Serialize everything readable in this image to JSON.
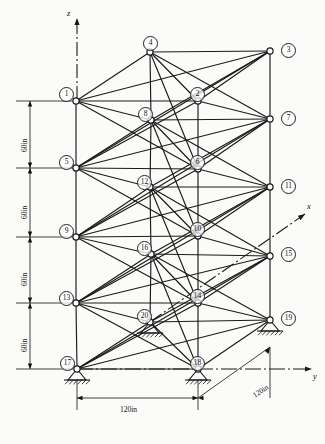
{
  "figure": {
    "type": "structural-truss-diagram",
    "caption": ""
  },
  "axes": {
    "z": {
      "label": "z",
      "direction": "up"
    },
    "y": {
      "label": "y",
      "direction": "right"
    },
    "x": {
      "label": "x",
      "direction": "up-right-isometric"
    }
  },
  "dimensions": {
    "vertical": [
      {
        "label": "60in",
        "value": 60,
        "unit": "in"
      },
      {
        "label": "60in",
        "value": 60,
        "unit": "in"
      },
      {
        "label": "60in",
        "value": 60,
        "unit": "in"
      },
      {
        "label": "60in",
        "value": 60,
        "unit": "in"
      }
    ],
    "horizontal": {
      "label": "120in",
      "value": 120,
      "unit": "in"
    },
    "depth": {
      "label": "120in",
      "value": 120,
      "unit": "in"
    }
  },
  "nodes": [
    {
      "id": "1",
      "label": "1",
      "x": 76,
      "y": 101,
      "lx": 59,
      "ly": 87,
      "face": "front-left"
    },
    {
      "id": "2",
      "label": "2",
      "x": 198,
      "y": 101,
      "lx": 190,
      "ly": 87,
      "face": "front-right"
    },
    {
      "id": "3",
      "label": "3",
      "x": 270,
      "y": 51,
      "lx": 281,
      "ly": 43,
      "face": "back-right"
    },
    {
      "id": "4",
      "label": "4",
      "x": 150,
      "y": 52,
      "lx": 143,
      "ly": 36,
      "face": "back-left"
    },
    {
      "id": "5",
      "label": "5",
      "x": 76,
      "y": 168,
      "lx": 59,
      "ly": 155,
      "face": "front-left"
    },
    {
      "id": "6",
      "label": "6",
      "x": 198,
      "y": 169,
      "lx": 190,
      "ly": 155,
      "face": "front-right"
    },
    {
      "id": "7",
      "label": "7",
      "x": 270,
      "y": 119,
      "lx": 281,
      "ly": 111,
      "face": "back-right"
    },
    {
      "id": "8",
      "label": "8",
      "x": 151,
      "y": 120,
      "lx": 138,
      "ly": 107,
      "face": "back-left"
    },
    {
      "id": "9",
      "label": "9",
      "x": 76,
      "y": 237,
      "lx": 59,
      "ly": 224,
      "face": "front-left"
    },
    {
      "id": "10",
      "label": "10",
      "x": 198,
      "y": 236,
      "lx": 190,
      "ly": 222,
      "face": "front-right"
    },
    {
      "id": "11",
      "label": "11",
      "x": 270,
      "y": 187,
      "lx": 281,
      "ly": 179,
      "face": "back-right"
    },
    {
      "id": "12",
      "label": "12",
      "x": 150,
      "y": 187,
      "lx": 137,
      "ly": 175,
      "face": "back-left"
    },
    {
      "id": "13",
      "label": "13",
      "x": 76,
      "y": 303,
      "lx": 59,
      "ly": 291,
      "face": "front-left"
    },
    {
      "id": "14",
      "label": "14",
      "x": 198,
      "y": 303,
      "lx": 190,
      "ly": 289,
      "face": "front-right"
    },
    {
      "id": "15",
      "label": "15",
      "x": 270,
      "y": 256,
      "lx": 281,
      "ly": 247,
      "face": "back-right"
    },
    {
      "id": "16",
      "label": "16",
      "x": 151,
      "y": 254,
      "lx": 137,
      "ly": 241,
      "face": "back-left"
    },
    {
      "id": "17",
      "label": "17",
      "x": 77,
      "y": 369,
      "lx": 60,
      "ly": 356,
      "face": "front-left"
    },
    {
      "id": "18",
      "label": "18",
      "x": 198,
      "y": 369,
      "lx": 190,
      "ly": 356,
      "face": "front-right"
    },
    {
      "id": "19",
      "label": "19",
      "x": 270,
      "y": 320,
      "lx": 281,
      "ly": 311,
      "face": "back-right"
    },
    {
      "id": "20",
      "label": "20",
      "x": 150,
      "y": 322,
      "lx": 137,
      "ly": 309,
      "face": "back-left"
    }
  ],
  "supports": [
    {
      "node": "17",
      "type": "pin",
      "x": 77,
      "y": 369
    },
    {
      "node": "18",
      "type": "pin",
      "x": 198,
      "y": 369
    },
    {
      "node": "19",
      "type": "pin",
      "x": 270,
      "y": 320
    },
    {
      "node": "20",
      "type": "pin",
      "x": 150,
      "y": 322
    }
  ],
  "members": [
    [
      "1",
      "2"
    ],
    [
      "4",
      "3"
    ],
    [
      "1",
      "4"
    ],
    [
      "2",
      "3"
    ],
    [
      "1",
      "3"
    ],
    [
      "4",
      "2"
    ],
    [
      "1",
      "8"
    ],
    [
      "4",
      "7"
    ],
    [
      "5",
      "6"
    ],
    [
      "8",
      "7"
    ],
    [
      "5",
      "8"
    ],
    [
      "6",
      "7"
    ],
    [
      "5",
      "7"
    ],
    [
      "8",
      "6"
    ],
    [
      "1",
      "5"
    ],
    [
      "2",
      "6"
    ],
    [
      "3",
      "7"
    ],
    [
      "4",
      "8"
    ],
    [
      "5",
      "2"
    ],
    [
      "1",
      "6"
    ],
    [
      "8",
      "3"
    ],
    [
      "4",
      "6"
    ],
    [
      "2",
      "7"
    ],
    [
      "5",
      "3"
    ],
    [
      "9",
      "10"
    ],
    [
      "12",
      "11"
    ],
    [
      "9",
      "12"
    ],
    [
      "10",
      "11"
    ],
    [
      "9",
      "11"
    ],
    [
      "12",
      "10"
    ],
    [
      "5",
      "12"
    ],
    [
      "8",
      "11"
    ],
    [
      "5",
      "9"
    ],
    [
      "6",
      "10"
    ],
    [
      "7",
      "11"
    ],
    [
      "8",
      "12"
    ],
    [
      "9",
      "6"
    ],
    [
      "5",
      "10"
    ],
    [
      "12",
      "7"
    ],
    [
      "8",
      "10"
    ],
    [
      "6",
      "11"
    ],
    [
      "9",
      "7"
    ],
    [
      "13",
      "14"
    ],
    [
      "16",
      "15"
    ],
    [
      "13",
      "16"
    ],
    [
      "14",
      "15"
    ],
    [
      "13",
      "15"
    ],
    [
      "16",
      "14"
    ],
    [
      "9",
      "16"
    ],
    [
      "12",
      "15"
    ],
    [
      "9",
      "13"
    ],
    [
      "10",
      "14"
    ],
    [
      "11",
      "15"
    ],
    [
      "12",
      "16"
    ],
    [
      "13",
      "10"
    ],
    [
      "9",
      "14"
    ],
    [
      "16",
      "11"
    ],
    [
      "12",
      "14"
    ],
    [
      "10",
      "15"
    ],
    [
      "13",
      "11"
    ],
    [
      "17",
      "18"
    ],
    [
      "20",
      "19"
    ],
    [
      "17",
      "20"
    ],
    [
      "18",
      "19"
    ],
    [
      "17",
      "19"
    ],
    [
      "20",
      "18"
    ],
    [
      "13",
      "20"
    ],
    [
      "16",
      "19"
    ],
    [
      "13",
      "17"
    ],
    [
      "14",
      "18"
    ],
    [
      "15",
      "19"
    ],
    [
      "16",
      "20"
    ],
    [
      "17",
      "14"
    ],
    [
      "13",
      "18"
    ],
    [
      "20",
      "15"
    ],
    [
      "16",
      "18"
    ],
    [
      "14",
      "19"
    ],
    [
      "17",
      "15"
    ]
  ],
  "colors": {
    "line": "#1a1a1a",
    "node_fill": "#ffffff",
    "background": "#fbfbf9",
    "dim": "#111111"
  }
}
